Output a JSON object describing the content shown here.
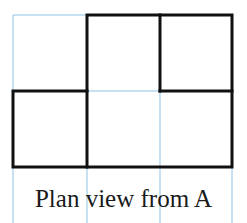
{
  "caption": "Plan view from A",
  "colors": {
    "grid": "#8fc3e8",
    "outline": "#111111",
    "background": "#ffffff"
  },
  "grid": {
    "columns_x": [
      13,
      87,
      160,
      232
    ],
    "rows_y": [
      15,
      91,
      167
    ],
    "extends_to_y": 223
  },
  "plan": {
    "cols": 3,
    "rows": 2,
    "filled_cells": [
      {
        "row": 0,
        "col": 1
      },
      {
        "row": 0,
        "col": 2
      },
      {
        "row": 1,
        "col": 0
      },
      {
        "row": 1,
        "col": 1
      },
      {
        "row": 1,
        "col": 2
      }
    ]
  }
}
